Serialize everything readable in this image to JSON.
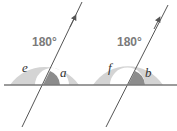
{
  "diagram": {
    "colors": {
      "annulus": "#d4d4d4",
      "wedge": "#8c8c8c",
      "line": "#555555",
      "baseline": "#7a7a7a",
      "label": "#7a7a7a"
    },
    "left": {
      "angle_total": "180°",
      "angle_outer": "e",
      "angle_inner": "a"
    },
    "right": {
      "angle_total": "180°",
      "angle_outer": "f",
      "angle_inner": "b"
    }
  }
}
